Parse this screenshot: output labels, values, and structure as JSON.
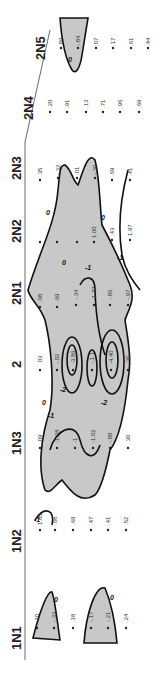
{
  "diagram": {
    "orientation": "rotated-90",
    "axis_labels": [
      "1N1",
      "1N2",
      "1N3",
      "2",
      "2N1",
      "2N2",
      "2N3",
      "2N4",
      "2N5"
    ],
    "contour_levels": [
      "0",
      "-1",
      "-2",
      "-3"
    ],
    "shading_color": "#c8c8c8",
    "columns": [
      {
        "label": "2N5",
        "values": [
          ".89",
          "-.84",
          ".07",
          ".17",
          ".61",
          ".44"
        ]
      },
      {
        "label": "2N4",
        "values": [
          ".20",
          ".91",
          ".13",
          ".71",
          ".96",
          ".69"
        ]
      },
      {
        "label": "2N3",
        "values": [
          ".35",
          "-.32",
          ".01",
          "-.30",
          ".69",
          ".41"
        ]
      },
      {
        "label": "2N2",
        "values": [
          "",
          "",
          "",
          "1.00",
          ".43",
          "1.97"
        ]
      },
      {
        "label": "2N1",
        "values": [
          ".08",
          ".69",
          "-.34",
          "-1.77",
          "-.86",
          "-.97"
        ]
      },
      {
        "label": "2",
        "values": [
          ".03",
          "-.02",
          "-3.86",
          "-.1.1",
          "-4.40",
          ".30"
        ]
      },
      {
        "label": "1N3",
        "values": [
          ".09",
          "-1.28",
          "-1",
          "-1.02",
          "-.88",
          ".30"
        ]
      },
      {
        "label": "1N2",
        "values": [
          "1.05",
          ".68",
          ".69",
          ".47",
          ".41",
          ".52"
        ]
      },
      {
        "label": "1N1",
        "values": [
          ".10",
          "-.33",
          ".18",
          "-.17",
          "-.21",
          ".24"
        ]
      }
    ]
  }
}
